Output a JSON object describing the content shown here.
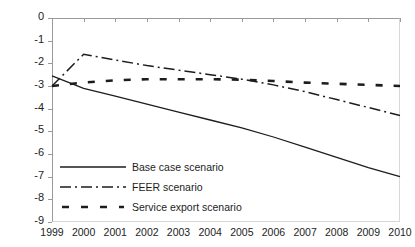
{
  "figure": {
    "clipped_top_text": "percentage of",
    "background": "#ffffff",
    "line_color": "#1d1d1d"
  },
  "chart_data": {
    "type": "line",
    "title": "",
    "subtitle": "",
    "xlabel": "",
    "ylabel": "",
    "x": [
      1999,
      2000,
      2001,
      2002,
      2003,
      2004,
      2005,
      2006,
      2007,
      2008,
      2009,
      2010
    ],
    "xticklabels": [
      "1999",
      "2000",
      "2001",
      "2002",
      "2003",
      "2004",
      "2005",
      "2006",
      "2007",
      "2008",
      "2009",
      "2010"
    ],
    "ylim": [
      -9,
      0
    ],
    "yticks": [
      0,
      -1,
      -2,
      -3,
      -4,
      -5,
      -6,
      -7,
      -8,
      -9
    ],
    "yticklabels": [
      "0",
      "-1",
      "-2",
      "-3",
      "-4",
      "-5",
      "-6",
      "-7",
      "-8",
      "-9"
    ],
    "grid": false,
    "legend_position": "lower left",
    "series": [
      {
        "name": "Base case scenario",
        "style": "solid",
        "color": "#1d1d1d",
        "values": [
          -2.55,
          -3.1,
          -3.45,
          -3.8,
          -4.15,
          -4.5,
          -4.85,
          -5.25,
          -5.7,
          -6.15,
          -6.6,
          -7.0
        ]
      },
      {
        "name": "FEER scenario",
        "style": "dashdot",
        "color": "#1d1d1d",
        "values": [
          -3.0,
          -1.6,
          -1.85,
          -2.1,
          -2.3,
          -2.5,
          -2.7,
          -2.95,
          -3.25,
          -3.6,
          -3.95,
          -4.3
        ]
      },
      {
        "name": "Service export scenario",
        "style": "dashed",
        "color": "#1d1d1d",
        "values": [
          -3.0,
          -2.85,
          -2.75,
          -2.7,
          -2.7,
          -2.7,
          -2.72,
          -2.78,
          -2.85,
          -2.9,
          -2.95,
          -3.0
        ]
      }
    ]
  },
  "legend": {
    "items": [
      {
        "label": "Base case scenario",
        "style": "solid"
      },
      {
        "label": "FEER scenario",
        "style": "dashdot"
      },
      {
        "label": "Service export scenario",
        "style": "dashed"
      }
    ]
  }
}
